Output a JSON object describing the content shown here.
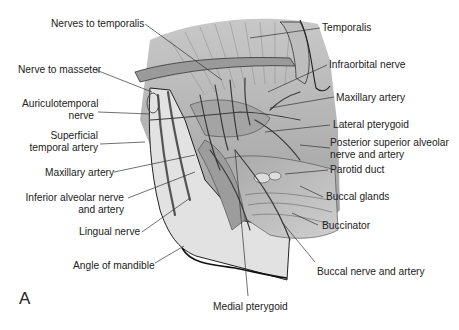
{
  "figure": {
    "panel_letter": "A",
    "left_labels": [
      {
        "id": "nerves-to-temporalis",
        "text": "Nerves to temporalis"
      },
      {
        "id": "nerve-to-masseter",
        "text": "Nerve to masseter"
      },
      {
        "id": "auriculotemporal-nerve",
        "line1": "Auriculotemporal",
        "line2": "nerve"
      },
      {
        "id": "superficial-temporal-artery",
        "line1": "Superficial",
        "line2": "temporal artery"
      },
      {
        "id": "maxillary-artery-left",
        "text": "Maxillary artery"
      },
      {
        "id": "inferior-alveolar-nerve-and-artery",
        "line1": "Inferior alveolar nerve",
        "line2": "and artery"
      },
      {
        "id": "lingual-nerve",
        "text": "Lingual nerve"
      },
      {
        "id": "angle-of-mandible",
        "text": "Angle of mandible"
      }
    ],
    "right_labels": [
      {
        "id": "temporalis",
        "text": "Temporalis"
      },
      {
        "id": "infraorbital-nerve",
        "text": "Infraorbital nerve"
      },
      {
        "id": "maxillary-artery-right",
        "text": "Maxillary artery"
      },
      {
        "id": "lateral-pterygoid",
        "text": "Lateral pterygoid"
      },
      {
        "id": "posterior-superior-alveolar",
        "line1": "Posterior superior alveolar",
        "line2": "nerve and artery"
      },
      {
        "id": "parotid-duct",
        "text": "Parotid duct"
      },
      {
        "id": "buccal-glands",
        "text": "Buccal glands"
      },
      {
        "id": "buccinator",
        "text": "Buccinator"
      },
      {
        "id": "buccal-nerve-and-artery",
        "text": "Buccal nerve and artery"
      }
    ],
    "bottom_labels": [
      {
        "id": "medial-pterygoid",
        "text": "Medial pterygoid"
      }
    ],
    "colors": {
      "background": "#ffffff",
      "tissue_light": "#d9d9d9",
      "tissue_mid": "#b5b5b5",
      "tissue_dark": "#7a7a7a",
      "outline": "#2a2a2a",
      "leader_line": "#333333",
      "text": "#222222"
    }
  }
}
